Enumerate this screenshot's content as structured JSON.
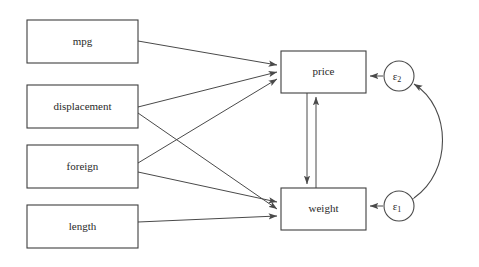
{
  "diagram": {
    "type": "path-diagram",
    "title": "",
    "background_color": "#ffffff",
    "stroke_color": "#4a4a4a",
    "box_stroke_color": "#3f3f3f",
    "text_color": "#2a2a2a",
    "exogenous_nodes": [
      {
        "id": "mpg",
        "label": "mpg",
        "x": 27,
        "y": 20,
        "w": 111,
        "h": 43
      },
      {
        "id": "displacement",
        "label": "displacement",
        "x": 27,
        "y": 85,
        "w": 111,
        "h": 43
      },
      {
        "id": "foreign",
        "label": "foreign",
        "x": 27,
        "y": 145,
        "w": 111,
        "h": 43
      },
      {
        "id": "length",
        "label": "length",
        "x": 27,
        "y": 205,
        "w": 111,
        "h": 43
      }
    ],
    "endogenous_nodes": [
      {
        "id": "price",
        "label": "price",
        "x": 281,
        "y": 51,
        "w": 85,
        "h": 42
      },
      {
        "id": "weight",
        "label": "weight",
        "x": 281,
        "y": 188,
        "w": 85,
        "h": 42
      }
    ],
    "error_nodes": [
      {
        "id": "e2",
        "label": "ε",
        "subscript": "2",
        "cx": 399,
        "cy": 76,
        "r": 15
      },
      {
        "id": "e1",
        "label": "ε",
        "subscript": "1",
        "cx": 399,
        "cy": 206,
        "r": 15
      }
    ],
    "edges": [
      {
        "from": "mpg",
        "to": "price",
        "kind": "directed"
      },
      {
        "from": "displacement",
        "to": "price",
        "kind": "directed"
      },
      {
        "from": "displacement",
        "to": "weight",
        "kind": "directed"
      },
      {
        "from": "foreign",
        "to": "price",
        "kind": "directed"
      },
      {
        "from": "foreign",
        "to": "weight",
        "kind": "directed"
      },
      {
        "from": "length",
        "to": "weight",
        "kind": "directed"
      },
      {
        "from": "price",
        "to": "weight",
        "kind": "directed"
      },
      {
        "from": "weight",
        "to": "price",
        "kind": "directed"
      },
      {
        "from": "e2",
        "to": "price",
        "kind": "directed"
      },
      {
        "from": "e1",
        "to": "weight",
        "kind": "directed"
      },
      {
        "from": "e1",
        "to": "e2",
        "kind": "bidirected-curved"
      }
    ]
  }
}
